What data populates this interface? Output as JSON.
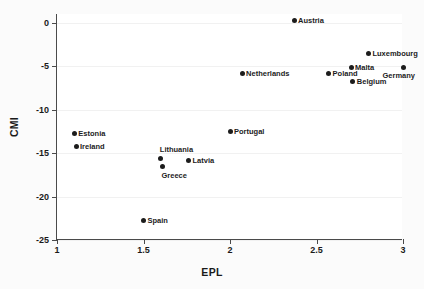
{
  "chart_data": {
    "type": "scatter",
    "title": "",
    "xlabel": "EPL",
    "ylabel": "CMI",
    "xlim": [
      1,
      3
    ],
    "ylim": [
      -25,
      1
    ],
    "xticks": [
      "1",
      "1.5",
      "2",
      "2.5",
      "3"
    ],
    "xtick_values": [
      1,
      1.5,
      2,
      2.5,
      3
    ],
    "yticks": [
      "0",
      "-5",
      "-10",
      "-15",
      "-20",
      "-25"
    ],
    "ytick_values": [
      0,
      -5,
      -10,
      -15,
      -20,
      -25
    ],
    "grid": "horizontal-faint",
    "legend": "none",
    "marker_color": "#1c1c1c",
    "points": [
      {
        "label": "Austria",
        "x": 2.37,
        "y": 0.3,
        "label_pos": "right"
      },
      {
        "label": "Luxembourg",
        "x": 2.8,
        "y": -3.5,
        "label_pos": "right"
      },
      {
        "label": "Malta",
        "x": 2.7,
        "y": -5.1,
        "label_pos": "right"
      },
      {
        "label": "Germany",
        "x": 3.0,
        "y": -5.1,
        "label_pos": "belowleft"
      },
      {
        "label": "Poland",
        "x": 2.57,
        "y": -5.9,
        "label_pos": "right"
      },
      {
        "label": "Netherlands",
        "x": 2.07,
        "y": -5.9,
        "label_pos": "right"
      },
      {
        "label": "Belgium",
        "x": 2.71,
        "y": -6.8,
        "label_pos": "right"
      },
      {
        "label": "Portugal",
        "x": 2.0,
        "y": -12.5,
        "label_pos": "right"
      },
      {
        "label": "Estonia",
        "x": 1.1,
        "y": -12.7,
        "label_pos": "right"
      },
      {
        "label": "Ireland",
        "x": 1.11,
        "y": -14.2,
        "label_pos": "right"
      },
      {
        "label": "Lithuania",
        "x": 1.6,
        "y": -15.6,
        "label_pos": "above"
      },
      {
        "label": "Latvia",
        "x": 1.76,
        "y": -15.9,
        "label_pos": "right"
      },
      {
        "label": "Greece",
        "x": 1.61,
        "y": -16.6,
        "label_pos": "below"
      },
      {
        "label": "Spain",
        "x": 1.5,
        "y": -22.7,
        "label_pos": "right"
      }
    ]
  }
}
